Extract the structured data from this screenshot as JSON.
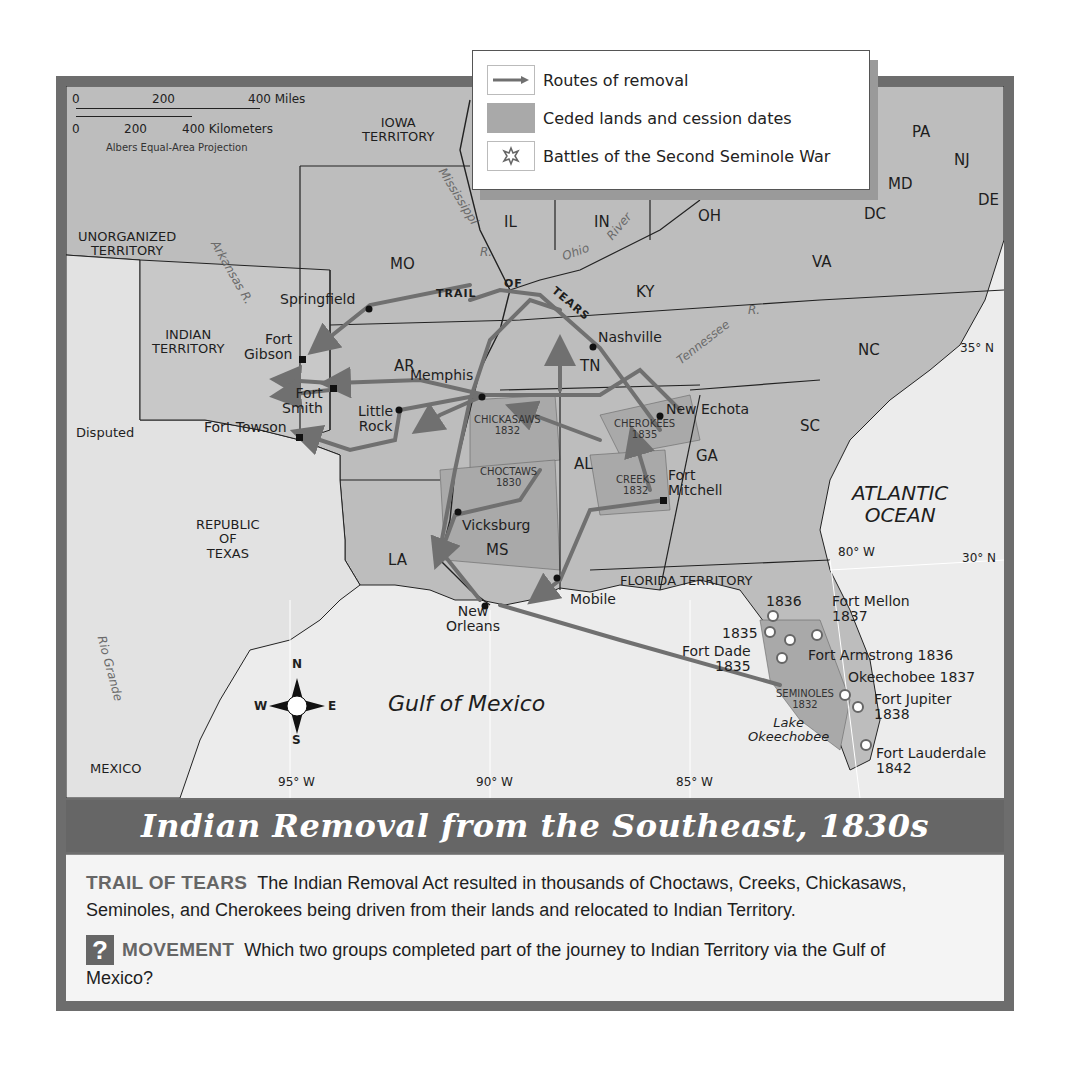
{
  "title": "Indian Removal from the Southeast, 1830s",
  "legend": {
    "items": [
      {
        "icon": "arrow-route-icon",
        "label": "Routes of removal"
      },
      {
        "icon": "ceded-land-swatch",
        "label": "Ceded lands and cession dates"
      },
      {
        "icon": "battle-star-icon",
        "label": "Battles of the Second Seminole War"
      }
    ]
  },
  "scale": {
    "miles_ticks": [
      "0",
      "200",
      "400 Miles"
    ],
    "km_ticks": [
      "0",
      "200",
      "400 Kilometers"
    ],
    "projection": "Albers Equal-Area Projection"
  },
  "compass": {
    "n": "N",
    "s": "S",
    "e": "E",
    "w": "W"
  },
  "states": {
    "iowa": "IOWA\nTERRITORY",
    "mo": "MO",
    "il": "IL",
    "in": "IN",
    "oh": "OH",
    "ky": "KY",
    "va": "VA",
    "pa": "PA",
    "nj": "NJ",
    "md": "MD",
    "dc": "DC",
    "de": "DE",
    "nc": "NC",
    "tn": "TN",
    "ar": "AR",
    "sc": "SC",
    "ga": "GA",
    "al": "AL",
    "ms": "MS",
    "la": "LA",
    "florida": "FLORIDA TERRITORY",
    "unorganized": "UNORGANIZED\nTERRITORY",
    "indian_territory": "INDIAN\nTERRITORY",
    "disputed": "Disputed",
    "texas": "REPUBLIC\nOF\nTEXAS",
    "mexico": "MEXICO"
  },
  "water": {
    "atlantic": "ATLANTIC\nOCEAN",
    "gulf": "Gulf  of  Mexico",
    "lake": "Lake\nOkeechobee",
    "mississippi": "Mississippi",
    "mississippi_r": "R.",
    "ohio": "Ohio",
    "ohio_river": "River",
    "tennessee": "Tennessee",
    "tennessee_r": "R.",
    "arkansas": "Arkansas R.",
    "rio_grande": "Rio Grande"
  },
  "trail_label": {
    "trail": "TRAIL",
    "of": "OF",
    "tears": "TEARS"
  },
  "cities": {
    "springfield": "Springfield",
    "fort_gibson": "Fort\nGibson",
    "fort_smith": "Fort\nSmith",
    "fort_towson": "Fort Towson",
    "little_rock": "Little\nRock",
    "memphis": "Memphis",
    "nashville": "Nashville",
    "new_echota": "New Echota",
    "fort_mitchell": "Fort\nMitchell",
    "vicksburg": "Vicksburg",
    "new_orleans": "New\nOrleans",
    "mobile": "Mobile"
  },
  "cessions": [
    {
      "name": "CHICKASAWS",
      "year": "1832"
    },
    {
      "name": "CHOCTAWS",
      "year": "1830"
    },
    {
      "name": "CHEROKEES",
      "year": "1835"
    },
    {
      "name": "CREEKS",
      "year": "1832"
    },
    {
      "name": "SEMINOLES",
      "year": "1832"
    }
  ],
  "battles": [
    {
      "label": "1836"
    },
    {
      "label": "1835"
    },
    {
      "label": "Fort Dade\n1835"
    },
    {
      "label": "Fort Mellon\n1837"
    },
    {
      "label": "Fort Armstrong 1836"
    },
    {
      "label": "Okeechobee 1837"
    },
    {
      "label": "Fort Jupiter\n1838"
    },
    {
      "label": "Fort Lauderdale\n1842"
    }
  ],
  "coordinates": {
    "lon95": "95° W",
    "lon90": "90° W",
    "lon85": "85° W",
    "lon80": "80° W",
    "lat35": "35° N",
    "lat30": "30° N"
  },
  "caption": {
    "heading1": "TRAIL OF TEARS",
    "text1": "The Indian Removal Act resulted in thousands of Choctaws, Creeks, Chickasaws, Seminoles, and Cherokees being driven from their lands and relocated to Indian Territory.",
    "question_icon": "?",
    "heading2": "MOVEMENT",
    "text2": "Which two groups completed part of the journey to Indian Territory via the Gulf of Mexico?"
  },
  "colors": {
    "ceded": "#a9a9a9",
    "states": "#bdbdbd",
    "water": "#ececec",
    "route": "#707070",
    "frame": "#6d6d6d"
  }
}
